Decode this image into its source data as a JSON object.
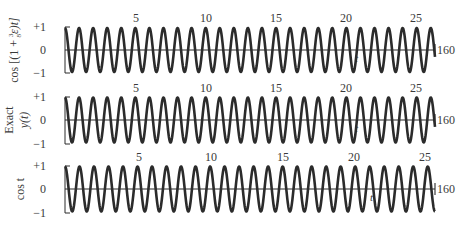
{
  "figure": {
    "width": 471,
    "height": 225,
    "ink_color": "#2b2b2b",
    "background": "#ffffff"
  },
  "chart_data": [
    {
      "type": "line",
      "panel": "top",
      "ylabel": "cos [(1 + 3/8 ε)t]",
      "ylabel_parts": {
        "prefix": "cos [(1 + ",
        "frac_num": "3",
        "frac_den": "8",
        "suffix": " ε)t]"
      },
      "yticks": [
        "+1",
        "0",
        "−1"
      ],
      "ylim": [
        -1,
        1
      ],
      "xticks": [
        "5",
        "10",
        "15",
        "20",
        "25"
      ],
      "xtick_values": [
        5,
        10,
        15,
        20,
        25
      ],
      "x_axis_label": "t",
      "x_end_label": "160",
      "x_range_periods": [
        0,
        26.3
      ],
      "frequency_description": "cos of (1 + 3ε/8)t — perturbed frequency",
      "grid": false
    },
    {
      "type": "line",
      "panel": "middle",
      "ylabel": "Exact y(t)",
      "ylabel_lines": [
        "Exact",
        "y(t)"
      ],
      "yticks": [
        "+1",
        "0",
        "−1"
      ],
      "ylim": [
        -1,
        1
      ],
      "xticks": [
        "5",
        "10",
        "15",
        "20",
        "25"
      ],
      "xtick_values": [
        5,
        10,
        15,
        20,
        25
      ],
      "x_axis_label": "t",
      "x_end_label": "160",
      "x_range_periods": [
        0,
        26.3
      ],
      "grid": false
    },
    {
      "type": "line",
      "panel": "bottom",
      "ylabel": "cos t",
      "yticks": [
        "+1",
        "0",
        "−1"
      ],
      "ylim": [
        -1,
        1
      ],
      "xticks": [
        "5",
        "10",
        "15",
        "20",
        "25"
      ],
      "xtick_values": [
        5,
        10,
        15,
        20,
        25
      ],
      "x_axis_label": "t",
      "x_end_label": "160",
      "x_range_periods": [
        0,
        25.5
      ],
      "grid": false
    }
  ],
  "labels": {
    "top_ylabel": "cos [(1 + ",
    "top_frac_num": "3",
    "top_frac_den": "8",
    "top_suffix": "ε)t]",
    "mid_ylabel_1": "Exact",
    "mid_ylabel_2": "y(t)",
    "bot_ylabel": "cos t",
    "ytick_plus": "+1",
    "ytick_zero": "0",
    "ytick_minus": "−1",
    "t": "t",
    "end": "160",
    "x5": "5",
    "x10": "10",
    "x15": "15",
    "x20": "20",
    "x25": "25"
  }
}
